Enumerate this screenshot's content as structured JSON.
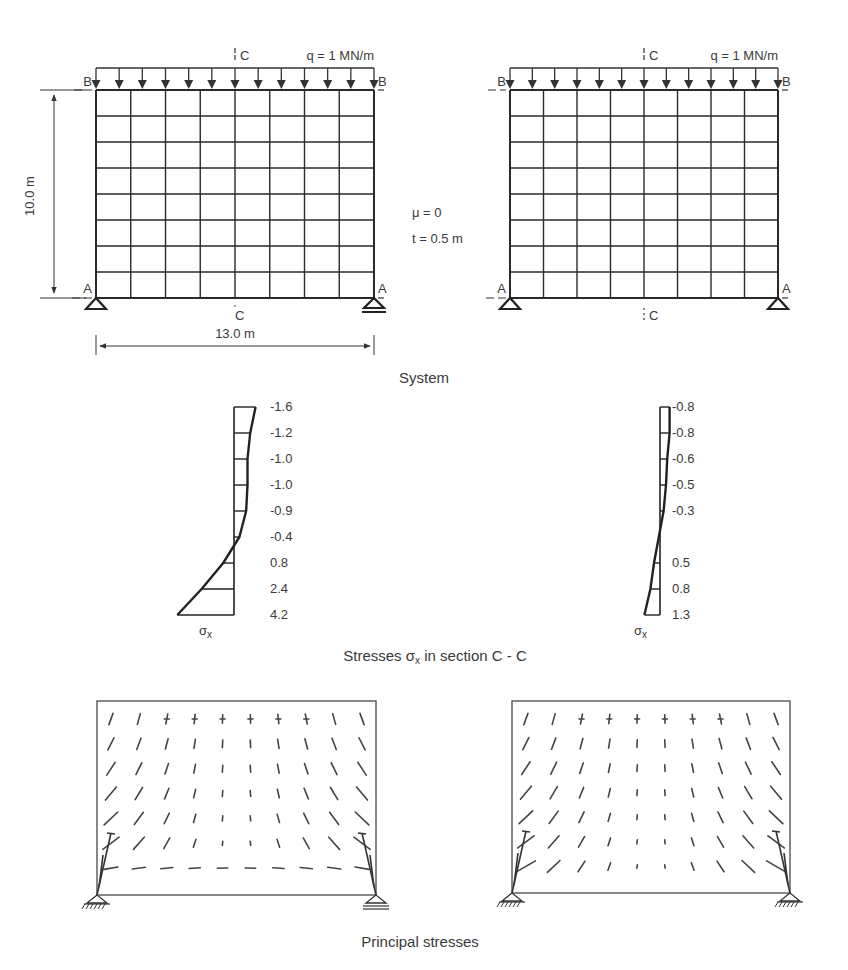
{
  "figure": {
    "panels": [
      {
        "id": "left",
        "support_condition": "pin left, roller right",
        "load_label": "q = 1 MN/m",
        "section_label": "C",
        "top_edge_label": "B",
        "bottom_edge_label": "A",
        "mesh": {
          "columns": 8,
          "rows": 8
        },
        "load_arrows": 13,
        "stress_section": {
          "symbol": "σ",
          "subscript": "x",
          "values": [
            "-1.6",
            "-1.2",
            "-1.0",
            "-1.0",
            "-0.9",
            "-0.4",
            "0.8",
            "2.4",
            "4.2"
          ],
          "numeric": [
            -1.6,
            -1.2,
            -1.0,
            -1.0,
            -0.9,
            -0.4,
            0.8,
            2.4,
            4.2
          ]
        }
      },
      {
        "id": "right",
        "support_condition": "pin both sides",
        "load_label": "q = 1 MN/m",
        "section_label": "C",
        "top_edge_label": "B",
        "bottom_edge_label": "A",
        "mesh": {
          "columns": 8,
          "rows": 8
        },
        "load_arrows": 13,
        "stress_section": {
          "symbol": "σ",
          "subscript": "x",
          "values": [
            "-0.8",
            "-0.8",
            "-0.6",
            "-0.5",
            "-0.3",
            "",
            "0.5",
            "0.8",
            "1.3"
          ],
          "numeric": [
            -0.8,
            -0.8,
            -0.6,
            -0.5,
            -0.3,
            null,
            0.5,
            0.8,
            1.3
          ]
        }
      }
    ],
    "dimensions": {
      "height_label": "10.0 m",
      "width_label": "13.0 m"
    },
    "parameters": {
      "mu_label": "μ = 0",
      "thickness_label": "t = 0.5 m"
    },
    "captions": {
      "system": "System",
      "stresses_prefix": "Stresses ",
      "stresses_symbol": "σ",
      "stresses_sub": "x",
      "stresses_suffix": " in section C - C",
      "principal": "Principal stresses"
    }
  }
}
